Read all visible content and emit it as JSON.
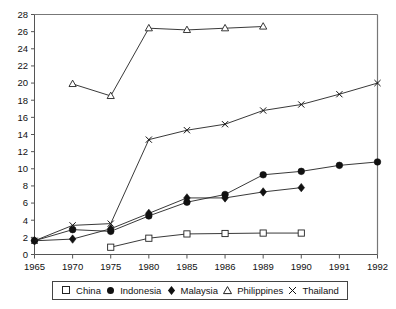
{
  "chart_data": {
    "type": "line",
    "title": "",
    "subtitle": "",
    "xlabel": "",
    "ylabel": "",
    "categories": [
      "1965",
      "1970",
      "1975",
      "1980",
      "1985",
      "1986",
      "1989",
      "1990",
      "1991",
      "1992"
    ],
    "ylim": [
      0,
      28
    ],
    "ytick_step": 2,
    "yticks": [
      "0",
      "2",
      "4",
      "6",
      "8",
      "10",
      "12",
      "14",
      "16",
      "18",
      "20",
      "22",
      "24",
      "26",
      "28"
    ],
    "grid": false,
    "legend_position": "below-plot",
    "series": [
      {
        "name": "China",
        "marker": "open-square",
        "x": [
          "1975",
          "1980",
          "1985",
          "1986",
          "1989",
          "1990"
        ],
        "values": [
          0.85,
          1.9,
          2.4,
          2.45,
          2.5,
          2.5
        ]
      },
      {
        "name": "Indonesia",
        "marker": "filled-circle",
        "x": [
          "1965",
          "1970",
          "1975",
          "1980",
          "1985",
          "1986",
          "1989",
          "1990",
          "1991",
          "1992"
        ],
        "values": [
          1.6,
          2.9,
          2.7,
          4.5,
          6.1,
          7.0,
          9.3,
          9.7,
          10.4,
          10.8
        ]
      },
      {
        "name": "Malaysia",
        "marker": "filled-diamond",
        "x": [
          "1965",
          "1970",
          "1975",
          "1980",
          "1985",
          "1986",
          "1989",
          "1990"
        ],
        "values": [
          1.6,
          1.8,
          3.0,
          4.8,
          6.6,
          6.6,
          7.3,
          7.8
        ]
      },
      {
        "name": "Philippines",
        "marker": "open-triangle",
        "x": [
          "1970",
          "1975",
          "1980",
          "1985",
          "1986",
          "1989"
        ],
        "values": [
          19.9,
          18.5,
          26.4,
          26.2,
          26.4,
          26.6
        ]
      },
      {
        "name": "Thailand",
        "marker": "cross",
        "x": [
          "1965",
          "1970",
          "1975",
          "1980",
          "1985",
          "1986",
          "1989",
          "1990",
          "1991",
          "1992"
        ],
        "values": [
          1.6,
          3.4,
          3.6,
          13.4,
          14.5,
          15.2,
          16.8,
          17.5,
          18.7,
          20.0
        ]
      }
    ]
  },
  "legend": {
    "items": [
      {
        "label": "China",
        "marker": "open-square"
      },
      {
        "label": "Indonesia",
        "marker": "filled-circle"
      },
      {
        "label": "Malaysia",
        "marker": "filled-diamond"
      },
      {
        "label": "Philippines",
        "marker": "open-triangle"
      },
      {
        "label": "Thailand",
        "marker": "cross"
      }
    ]
  },
  "colors": {
    "line": "#222222",
    "axis": "#555555",
    "frame": "#777777",
    "text": "#111111",
    "background": "#ffffff"
  }
}
